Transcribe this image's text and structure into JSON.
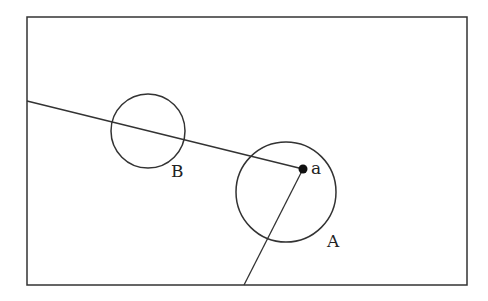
{
  "diagram": {
    "frame": {
      "x": 27,
      "y": 17,
      "width": 440,
      "height": 268,
      "stroke": "#333333"
    },
    "circles": [
      {
        "id": "B",
        "label": "B",
        "cx": 148,
        "cy": 131,
        "r": 37,
        "label_x": 171,
        "label_y": 177
      },
      {
        "id": "A",
        "label": "A",
        "cx": 286,
        "cy": 192,
        "r": 50,
        "label_x": 327,
        "label_y": 247
      }
    ],
    "point": {
      "label": "a",
      "x": 303,
      "y": 169,
      "label_x": 311,
      "label_y": 174
    },
    "lines": [
      {
        "id": "line-left-to-a",
        "x1": 27,
        "y1": 101,
        "x2": 303,
        "y2": 169
      },
      {
        "id": "line-a-to-bottom",
        "x1": 303,
        "y1": 169,
        "x2": 244,
        "y2": 285
      }
    ],
    "stroke_color": "#333333"
  }
}
